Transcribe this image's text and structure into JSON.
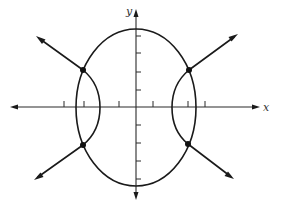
{
  "figure": {
    "axes": {
      "x_label": "x",
      "y_label": "y",
      "origin_px": [
        136,
        107
      ],
      "x_ticks_px": [
        64,
        84,
        119,
        153,
        188,
        205
      ],
      "y_ticks_px": [
        36,
        53,
        72,
        90,
        125,
        143,
        161,
        179
      ]
    },
    "ellipse": {
      "center_px": [
        136,
        107
      ],
      "rx_px": 60,
      "ry_px": 79
    },
    "hyperbola": {
      "center_px": [
        136,
        107
      ],
      "vertex_offset_px": 36,
      "branches": [
        "left",
        "right"
      ]
    },
    "intersection_points_px": [
      [
        83,
        70
      ],
      [
        189,
        70
      ],
      [
        83,
        145
      ],
      [
        188,
        144
      ]
    ],
    "colors": {
      "stroke": "#1a1a1a",
      "background": "#ffffff"
    }
  }
}
